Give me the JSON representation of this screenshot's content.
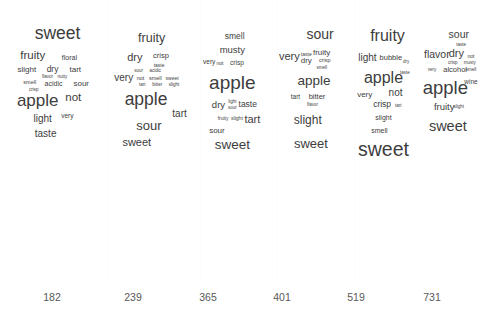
{
  "chart_data": {
    "type": "table",
    "title": "",
    "subtitle": "",
    "xlabel": "",
    "ylabel": "",
    "grid": true,
    "legend": "none",
    "panel_layout": "1 row x 6 columns",
    "panel_labels": [
      "182",
      "239",
      "365",
      "401",
      "519",
      "731"
    ],
    "panels": [
      {
        "label": "182",
        "words": [
          {
            "text": "sweet",
            "size": 17.5,
            "x": 50,
            "y": 34
          },
          {
            "text": "fruity",
            "size": 11.5,
            "x": 25,
            "y": 56
          },
          {
            "text": "floral",
            "size": 7.0,
            "x": 62,
            "y": 57
          },
          {
            "text": "slight",
            "size": 8.0,
            "x": 19,
            "y": 70
          },
          {
            "text": "dry",
            "size": 8.5,
            "x": 45,
            "y": 69
          },
          {
            "text": "tart",
            "size": 8.0,
            "x": 68,
            "y": 70
          },
          {
            "text": "flavor",
            "size": 4.5,
            "x": 40,
            "y": 77
          },
          {
            "text": "nutty",
            "size": 4.5,
            "x": 55,
            "y": 77
          },
          {
            "text": "smell",
            "size": 5.5,
            "x": 22,
            "y": 83
          },
          {
            "text": "acidic",
            "size": 7.0,
            "x": 46,
            "y": 83
          },
          {
            "text": "sour",
            "size": 8.0,
            "x": 74,
            "y": 84
          },
          {
            "text": "crisp",
            "size": 4.5,
            "x": 26,
            "y": 90
          },
          {
            "text": "apple",
            "size": 17.0,
            "x": 30,
            "y": 100
          },
          {
            "text": "not",
            "size": 11.5,
            "x": 66,
            "y": 98
          },
          {
            "text": "light",
            "size": 10.0,
            "x": 35,
            "y": 119
          },
          {
            "text": "very",
            "size": 6.5,
            "x": 60,
            "y": 116
          },
          {
            "text": "taste",
            "size": 10.0,
            "x": 38,
            "y": 134
          }
        ]
      },
      {
        "label": "239",
        "words": [
          {
            "text": "fruity",
            "size": 12.5,
            "x": 48,
            "y": 38
          },
          {
            "text": "dry",
            "size": 11.0,
            "x": 30,
            "y": 57
          },
          {
            "text": "crisp",
            "size": 7.5,
            "x": 58,
            "y": 56
          },
          {
            "text": "taste",
            "size": 5.0,
            "x": 56,
            "y": 65
          },
          {
            "text": "sour",
            "size": 4.5,
            "x": 34,
            "y": 71
          },
          {
            "text": "acidic",
            "size": 4.5,
            "x": 52,
            "y": 71
          },
          {
            "text": "very",
            "size": 10.0,
            "x": 18,
            "y": 78
          },
          {
            "text": "not",
            "size": 5.5,
            "x": 36,
            "y": 79
          },
          {
            "text": "smell",
            "size": 5.5,
            "x": 52,
            "y": 79
          },
          {
            "text": "sweet",
            "size": 5.0,
            "x": 70,
            "y": 78
          },
          {
            "text": "tart",
            "size": 4.5,
            "x": 38,
            "y": 85
          },
          {
            "text": "bitter",
            "size": 4.5,
            "x": 54,
            "y": 85
          },
          {
            "text": "slight",
            "size": 4.5,
            "x": 72,
            "y": 85
          },
          {
            "text": "apple",
            "size": 17.5,
            "x": 42,
            "y": 100
          },
          {
            "text": "tart",
            "size": 10.0,
            "x": 78,
            "y": 114
          },
          {
            "text": "sour",
            "size": 13.0,
            "x": 45,
            "y": 125
          },
          {
            "text": "sweet",
            "size": 11.0,
            "x": 32,
            "y": 142
          }
        ]
      },
      {
        "label": "365",
        "words": [
          {
            "text": "smell",
            "size": 8.5,
            "x": 45,
            "y": 36
          },
          {
            "text": "musty",
            "size": 9.5,
            "x": 42,
            "y": 50
          },
          {
            "text": "very",
            "size": 6.5,
            "x": 12,
            "y": 62
          },
          {
            "text": "not",
            "size": 5.0,
            "x": 26,
            "y": 63
          },
          {
            "text": "crisp",
            "size": 6.5,
            "x": 48,
            "y": 63
          },
          {
            "text": "apple",
            "size": 19.0,
            "x": 42,
            "y": 82
          },
          {
            "text": "dry",
            "size": 9.5,
            "x": 24,
            "y": 105
          },
          {
            "text": "light",
            "size": 4.5,
            "x": 42,
            "y": 102
          },
          {
            "text": "sour",
            "size": 4.5,
            "x": 42,
            "y": 108
          },
          {
            "text": "taste",
            "size": 8.5,
            "x": 62,
            "y": 104
          },
          {
            "text": "fruity",
            "size": 5.0,
            "x": 30,
            "y": 118
          },
          {
            "text": "slight",
            "size": 5.0,
            "x": 48,
            "y": 118
          },
          {
            "text": "tart",
            "size": 11.0,
            "x": 68,
            "y": 119
          },
          {
            "text": "sour",
            "size": 8.0,
            "x": 22,
            "y": 131
          },
          {
            "text": "sweet",
            "size": 13.5,
            "x": 42,
            "y": 145
          }
        ]
      },
      {
        "label": "401",
        "words": [
          {
            "text": "sour",
            "size": 14.0,
            "x": 56,
            "y": 34
          },
          {
            "text": "very",
            "size": 11.0,
            "x": 16,
            "y": 56
          },
          {
            "text": "taste",
            "size": 5.0,
            "x": 38,
            "y": 54
          },
          {
            "text": "fruity",
            "size": 8.0,
            "x": 58,
            "y": 53
          },
          {
            "text": "dry",
            "size": 8.0,
            "x": 38,
            "y": 61
          },
          {
            "text": "crisp",
            "size": 5.5,
            "x": 62,
            "y": 61
          },
          {
            "text": "smell",
            "size": 4.5,
            "x": 58,
            "y": 68
          },
          {
            "text": "apple",
            "size": 13.5,
            "x": 48,
            "y": 81
          },
          {
            "text": "tart",
            "size": 6.5,
            "x": 24,
            "y": 97
          },
          {
            "text": "bitter",
            "size": 7.5,
            "x": 52,
            "y": 97
          },
          {
            "text": "flavor",
            "size": 4.5,
            "x": 46,
            "y": 105
          },
          {
            "text": "slight",
            "size": 12.0,
            "x": 40,
            "y": 120
          },
          {
            "text": "sweet",
            "size": 13.0,
            "x": 44,
            "y": 143
          }
        ]
      },
      {
        "label": "519",
        "words": [
          {
            "text": "fruity",
            "size": 16.0,
            "x": 50,
            "y": 36
          },
          {
            "text": "light",
            "size": 10.0,
            "x": 20,
            "y": 58
          },
          {
            "text": "bubble",
            "size": 7.5,
            "x": 55,
            "y": 58
          },
          {
            "text": "dry",
            "size": 4.5,
            "x": 78,
            "y": 62
          },
          {
            "text": "apple",
            "size": 16.0,
            "x": 44,
            "y": 78
          },
          {
            "text": "taste",
            "size": 4.5,
            "x": 76,
            "y": 73
          },
          {
            "text": "very",
            "size": 8.0,
            "x": 16,
            "y": 95
          },
          {
            "text": "not",
            "size": 10.0,
            "x": 62,
            "y": 93
          },
          {
            "text": "crisp",
            "size": 8.5,
            "x": 42,
            "y": 104
          },
          {
            "text": "tart",
            "size": 4.5,
            "x": 66,
            "y": 106
          },
          {
            "text": "slight",
            "size": 7.0,
            "x": 44,
            "y": 117
          },
          {
            "text": "smell",
            "size": 7.0,
            "x": 38,
            "y": 130
          },
          {
            "text": "sweet",
            "size": 19.5,
            "x": 44,
            "y": 150
          }
        ]
      },
      {
        "label": "731",
        "words": [
          {
            "text": "sour",
            "size": 10.5,
            "x": 62,
            "y": 34
          },
          {
            "text": "taste",
            "size": 4.5,
            "x": 66,
            "y": 45
          },
          {
            "text": "flavor",
            "size": 10.5,
            "x": 26,
            "y": 54
          },
          {
            "text": "dry",
            "size": 11.0,
            "x": 58,
            "y": 53
          },
          {
            "text": "not",
            "size": 5.0,
            "x": 82,
            "y": 56
          },
          {
            "text": "crisp",
            "size": 4.5,
            "x": 52,
            "y": 63
          },
          {
            "text": "musty",
            "size": 4.5,
            "x": 80,
            "y": 63
          },
          {
            "text": "very",
            "size": 4.5,
            "x": 18,
            "y": 70
          },
          {
            "text": "alcohol",
            "size": 7.5,
            "x": 56,
            "y": 70
          },
          {
            "text": "smell",
            "size": 4.5,
            "x": 82,
            "y": 70
          },
          {
            "text": "apple",
            "size": 18.5,
            "x": 40,
            "y": 88
          },
          {
            "text": "wine",
            "size": 6.5,
            "x": 82,
            "y": 82
          },
          {
            "text": "fruity",
            "size": 9.5,
            "x": 38,
            "y": 107
          },
          {
            "text": "slight",
            "size": 4.5,
            "x": 62,
            "y": 107
          },
          {
            "text": "sweet",
            "size": 14.5,
            "x": 44,
            "y": 126
          }
        ]
      }
    ]
  },
  "panel_geometry": [
    {
      "left": 8,
      "width": 99
    },
    {
      "left": 107,
      "width": 93
    },
    {
      "left": 200,
      "width": 77
    },
    {
      "left": 277,
      "width": 77
    },
    {
      "left": 354,
      "width": 67
    },
    {
      "left": 421,
      "width": 61
    }
  ],
  "dividers": [
    107,
    200,
    277,
    354
  ],
  "label_positions": [
    52,
    133,
    208,
    282,
    356,
    432
  ],
  "colors": {
    "background": "#ffffff",
    "word_text": "#3d3d3d",
    "label_text": "#585858",
    "divider": "#fcfcfc"
  }
}
